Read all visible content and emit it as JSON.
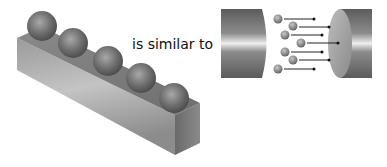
{
  "caption": {
    "text": "is similar to"
  },
  "left_figure": {
    "name": "block-with-spheres",
    "sphere_count": 5
  },
  "right_figure": {
    "name": "electrons-between-conductors",
    "electron_count": 7,
    "electron_symbol": "−"
  },
  "colors": {
    "background": "#ffffff",
    "text": "#111111",
    "metal_dark": "#5a5a5a",
    "metal_light": "#e8e8e8"
  }
}
